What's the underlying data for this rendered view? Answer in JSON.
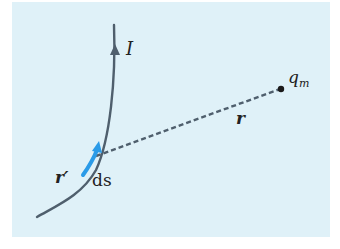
{
  "diagram": {
    "background_color": "#dff1f8",
    "wire_color": "#4f5f6d",
    "element_color": "#2a9be8",
    "labels": {
      "current": "I",
      "source_position": "r′",
      "element": "ds",
      "charge": "q",
      "charge_subscript": "m",
      "separation": "r"
    }
  }
}
